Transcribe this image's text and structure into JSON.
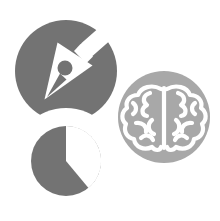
{
  "graphic": {
    "type": "icon-composition",
    "background_color": "#ffffff",
    "width": 220,
    "height": 221,
    "description": "Three overlapping circular icons: a pen nib, a pie chart, and a brain",
    "colors": {
      "dark_grey": "#737373",
      "light_grey": "#a8a8a8",
      "white": "#ffffff"
    },
    "circles": [
      {
        "id": "pen-circle",
        "icon_name": "pen-nib-icon",
        "label": "Pen nib",
        "fill": "#737373",
        "cx": 66,
        "cy": 71,
        "r": 51
      },
      {
        "id": "pie-circle",
        "icon_name": "pie-chart-icon",
        "label": "Pie chart",
        "fill": "#737373",
        "cx": 66,
        "cy": 161,
        "r": 47
      },
      {
        "id": "brain-circle",
        "icon_name": "brain-icon",
        "label": "Brain",
        "fill": "#a8a8a8",
        "cx": 164,
        "cy": 117,
        "r": 46
      }
    ]
  },
  "chart_data": {
    "type": "pie",
    "categories": [
      "Segment A",
      "Segment B"
    ],
    "values": [
      38,
      62
    ],
    "units": "percent",
    "colors": [
      "#737373",
      "#ffffff"
    ],
    "start_angle_deg": 0,
    "legend": "none",
    "grid": false
  }
}
